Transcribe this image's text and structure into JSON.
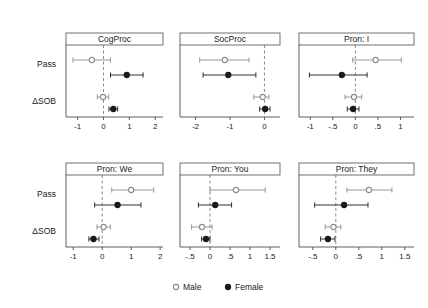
{
  "figure": {
    "kind": "forest-plot-grid",
    "rows": 2,
    "cols": 3,
    "y_categories": [
      "Pass",
      "ΔSOB"
    ],
    "zero_line": 0
  },
  "legend": {
    "position": "bottom-center",
    "entries": [
      {
        "label": "Male",
        "marker": "open-circle",
        "color": "#8c8c8c"
      },
      {
        "label": "Female",
        "marker": "filled-circle",
        "color": "#1a1a1a"
      }
    ]
  },
  "colors": {
    "male": "#8c8c8c",
    "female": "#1a1a1a",
    "axis": "#4d4d4d",
    "strip_border": "#4d4d4d",
    "strip_fill": "#ffffff",
    "zero_line": "#6e6e6e",
    "background": "#ffffff"
  },
  "chart_data": [
    {
      "type": "scatter",
      "title": "CogProc",
      "panel_index": 0,
      "xlabel": "",
      "ylabel": "",
      "xlim": [
        -1.45,
        2.3
      ],
      "ticks": [
        -1,
        0,
        1,
        2
      ],
      "tick_labels": [
        "-1",
        "0",
        "1",
        "2"
      ],
      "grid": false,
      "zero_reference": 0,
      "categories": [
        "Pass",
        "ΔSOB"
      ],
      "series": [
        {
          "name": "Male",
          "marker": "open-circle",
          "color": "#8c8c8c",
          "points": [
            {
              "category": "Pass",
              "estimate": -0.45,
              "ci_low": -1.18,
              "ci_high": 0.27
            },
            {
              "category": "ΔSOB",
              "estimate": -0.02,
              "ci_low": -0.24,
              "ci_high": 0.2
            }
          ]
        },
        {
          "name": "Female",
          "marker": "filled-circle",
          "color": "#1a1a1a",
          "points": [
            {
              "category": "Pass",
              "estimate": 0.9,
              "ci_low": 0.27,
              "ci_high": 1.53
            },
            {
              "category": "ΔSOB",
              "estimate": 0.38,
              "ci_low": 0.21,
              "ci_high": 0.55
            }
          ]
        }
      ]
    },
    {
      "type": "scatter",
      "title": "SocProc",
      "panel_index": 1,
      "xlabel": "",
      "ylabel": "",
      "xlim": [
        -2.45,
        0.45
      ],
      "ticks": [
        -2,
        -1,
        0
      ],
      "tick_labels": [
        "-2",
        "-1",
        "0"
      ],
      "grid": false,
      "zero_reference": 0,
      "categories": [
        "Pass",
        "ΔSOB"
      ],
      "series": [
        {
          "name": "Male",
          "marker": "open-circle",
          "color": "#8c8c8c",
          "points": [
            {
              "category": "Pass",
              "estimate": -1.15,
              "ci_low": -1.88,
              "ci_high": -0.45
            },
            {
              "category": "ΔSOB",
              "estimate": -0.05,
              "ci_low": -0.31,
              "ci_high": 0.13
            }
          ]
        },
        {
          "name": "Female",
          "marker": "filled-circle",
          "color": "#1a1a1a",
          "points": [
            {
              "category": "Pass",
              "estimate": -1.05,
              "ci_low": -1.78,
              "ci_high": -0.25
            },
            {
              "category": "ΔSOB",
              "estimate": 0.02,
              "ci_low": -0.14,
              "ci_high": 0.16
            }
          ]
        }
      ]
    },
    {
      "type": "scatter",
      "title": "Pron: I",
      "panel_index": 2,
      "xlabel": "",
      "ylabel": "",
      "xlim": [
        -1.25,
        1.3
      ],
      "ticks": [
        -1,
        -0.5,
        0,
        0.5,
        1
      ],
      "tick_labels": [
        "-1",
        "-.5",
        "0",
        ".5",
        "1"
      ],
      "grid": false,
      "zero_reference": 0,
      "categories": [
        "Pass",
        "ΔSOB"
      ],
      "series": [
        {
          "name": "Male",
          "marker": "open-circle",
          "color": "#8c8c8c",
          "points": [
            {
              "category": "Pass",
              "estimate": 0.45,
              "ci_low": -0.06,
              "ci_high": 1.02
            },
            {
              "category": "ΔSOB",
              "estimate": -0.03,
              "ci_low": -0.23,
              "ci_high": 0.14
            }
          ]
        },
        {
          "name": "Female",
          "marker": "filled-circle",
          "color": "#1a1a1a",
          "points": [
            {
              "category": "Pass",
              "estimate": -0.3,
              "ci_low": -1.02,
              "ci_high": 0.26
            },
            {
              "category": "ΔSOB",
              "estimate": -0.05,
              "ci_low": -0.18,
              "ci_high": 0.08
            }
          ]
        }
      ]
    },
    {
      "type": "scatter",
      "title": "Pron: We",
      "panel_index": 3,
      "xlabel": "",
      "ylabel": "",
      "xlim": [
        -1.25,
        2.1
      ],
      "ticks": [
        -1,
        0,
        1,
        2
      ],
      "tick_labels": [
        "-1",
        "0",
        "1",
        "2"
      ],
      "grid": false,
      "zero_reference": 0,
      "categories": [
        "Pass",
        "ΔSOB"
      ],
      "series": [
        {
          "name": "Male",
          "marker": "open-circle",
          "color": "#8c8c8c",
          "points": [
            {
              "category": "Pass",
              "estimate": 1.0,
              "ci_low": 0.33,
              "ci_high": 1.78
            },
            {
              "category": "ΔSOB",
              "estimate": 0.05,
              "ci_low": -0.18,
              "ci_high": 0.28
            }
          ]
        },
        {
          "name": "Female",
          "marker": "filled-circle",
          "color": "#1a1a1a",
          "points": [
            {
              "category": "Pass",
              "estimate": 0.53,
              "ci_low": -0.26,
              "ci_high": 1.34
            },
            {
              "category": "ΔSOB",
              "estimate": -0.3,
              "ci_low": -0.46,
              "ci_high": -0.11
            }
          ]
        }
      ]
    },
    {
      "type": "scatter",
      "title": "Pron: You",
      "panel_index": 4,
      "xlabel": "",
      "ylabel": "",
      "xlim": [
        -0.75,
        1.75
      ],
      "ticks": [
        -0.5,
        0,
        0.5,
        1,
        1.5
      ],
      "tick_labels": [
        "-.5",
        "0",
        ".5",
        "1",
        "1.5"
      ],
      "grid": false,
      "zero_reference": 0,
      "categories": [
        "Pass",
        "ΔSOB"
      ],
      "series": [
        {
          "name": "Male",
          "marker": "open-circle",
          "color": "#8c8c8c",
          "points": [
            {
              "category": "Pass",
              "estimate": 0.65,
              "ci_low": 0.0,
              "ci_high": 1.38
            },
            {
              "category": "ΔSOB",
              "estimate": -0.2,
              "ci_low": -0.46,
              "ci_high": 0.05
            }
          ]
        },
        {
          "name": "Female",
          "marker": "filled-circle",
          "color": "#1a1a1a",
          "points": [
            {
              "category": "Pass",
              "estimate": 0.13,
              "ci_low": -0.29,
              "ci_high": 0.54
            },
            {
              "category": "ΔSOB",
              "estimate": -0.1,
              "ci_low": -0.21,
              "ci_high": 0.0
            }
          ]
        }
      ]
    },
    {
      "type": "scatter",
      "title": "Pron: They",
      "panel_index": 5,
      "xlabel": "",
      "ylabel": "",
      "xlim": [
        -0.8,
        1.7
      ],
      "ticks": [
        -0.5,
        0,
        0.5,
        1,
        1.5
      ],
      "tick_labels": [
        "-.5",
        "0",
        ".5",
        "1",
        "1.5"
      ],
      "grid": false,
      "zero_reference": 0,
      "categories": [
        "Pass",
        "ΔSOB"
      ],
      "series": [
        {
          "name": "Male",
          "marker": "open-circle",
          "color": "#8c8c8c",
          "points": [
            {
              "category": "Pass",
              "estimate": 0.72,
              "ci_low": 0.24,
              "ci_high": 1.22
            },
            {
              "category": "ΔSOB",
              "estimate": -0.05,
              "ci_low": -0.23,
              "ci_high": 0.11
            }
          ]
        },
        {
          "name": "Female",
          "marker": "filled-circle",
          "color": "#1a1a1a",
          "points": [
            {
              "category": "Pass",
              "estimate": 0.18,
              "ci_low": -0.46,
              "ci_high": 0.7
            },
            {
              "category": "ΔSOB",
              "estimate": -0.17,
              "ci_low": -0.33,
              "ci_high": -0.02
            }
          ]
        }
      ]
    }
  ]
}
